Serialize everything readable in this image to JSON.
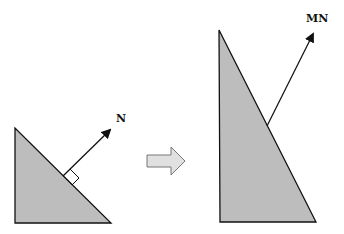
{
  "diagram": {
    "left": {
      "vector_label": "N",
      "right_angle_marker": true
    },
    "transition": {
      "arrow_icon": "right-arrow-icon"
    },
    "right": {
      "vector_label": "MN"
    },
    "colors": {
      "triangle_fill": "#bdbdbd",
      "stroke": "#111111",
      "arrow_fill": "#e0e0e0",
      "arrow_stroke": "#777777"
    }
  }
}
